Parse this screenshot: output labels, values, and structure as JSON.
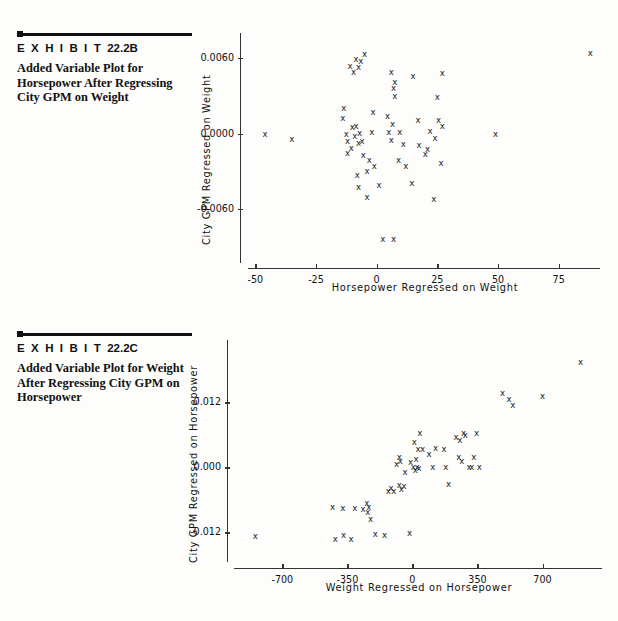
{
  "page": {
    "background": "#fdfdfb",
    "ink": "#111111"
  },
  "exhibits": [
    {
      "id": "22.2B",
      "label_word": "E X H I B I T",
      "number": "22.2B",
      "caption": "Added Variable Plot for Horsepower After Regressing City GPM on Weight"
    },
    {
      "id": "22.2C",
      "label_word": "E X H I B I T",
      "number": "22.2C",
      "caption": "Added Variable Plot for Weight After Regressing City GPM on Horsepower"
    }
  ],
  "chart_data": [
    {
      "type": "scatter",
      "title": "",
      "xlabel": "Horsepower Regressed on Weight",
      "ylabel": "City GPM Regressed on Weight",
      "xticks": [
        -50,
        -25,
        0,
        25,
        50,
        75
      ],
      "xticklabels": [
        "-50",
        "-25",
        "0",
        "25",
        "50",
        "75"
      ],
      "yticks": [
        0.006,
        0.0,
        -0.006
      ],
      "yticklabels": [
        "0.0060",
        "0.0000",
        "-0.0060"
      ],
      "xlim": [
        -53,
        92
      ],
      "ylim": [
        -0.0102,
        0.008
      ],
      "grid": false,
      "legend": "none",
      "marker": "x",
      "points": [
        [
          -46.0,
          0.0
        ],
        [
          -35.0,
          -0.00045
        ],
        [
          -12.5,
          0.0
        ],
        [
          -12.0,
          -0.0006
        ],
        [
          -10.5,
          -0.0011
        ],
        [
          -12.0,
          -0.0015
        ],
        [
          -9.0,
          -0.0002
        ],
        [
          -10.0,
          0.00052
        ],
        [
          -13.5,
          0.002
        ],
        [
          -14.0,
          0.00122
        ],
        [
          -11.0,
          0.0054
        ],
        [
          -9.5,
          0.00492
        ],
        [
          -8.5,
          0.0059
        ],
        [
          -7.5,
          0.0053
        ],
        [
          -6.5,
          0.00575
        ],
        [
          -5.0,
          0.0063
        ],
        [
          -8.5,
          0.0006
        ],
        [
          -7.0,
          5e-05
        ],
        [
          -7.5,
          -0.00075
        ],
        [
          -6.0,
          -0.00055
        ],
        [
          -5.5,
          -0.0017
        ],
        [
          -4.0,
          -0.003
        ],
        [
          -8.0,
          -0.0033
        ],
        [
          -7.5,
          -0.0042
        ],
        [
          -4.0,
          -0.005
        ],
        [
          -2.0,
          0.0001
        ],
        [
          -1.5,
          0.00175
        ],
        [
          -3.0,
          -0.0021
        ],
        [
          -1.0,
          -0.0026
        ],
        [
          1.0,
          -0.0041
        ],
        [
          2.5,
          -0.0084
        ],
        [
          7.0,
          -0.0084
        ],
        [
          5.0,
          0.0001
        ],
        [
          6.0,
          -0.0005
        ],
        [
          6.5,
          0.0008
        ],
        [
          4.5,
          0.0014
        ],
        [
          7.5,
          0.003
        ],
        [
          7.0,
          0.00365
        ],
        [
          7.5,
          0.00408
        ],
        [
          6.0,
          0.0049
        ],
        [
          9.5,
          0.00012
        ],
        [
          11.0,
          -0.0008
        ],
        [
          9.0,
          -0.0021
        ],
        [
          12.0,
          -0.00255
        ],
        [
          14.5,
          -0.0039
        ],
        [
          15.0,
          0.0046
        ],
        [
          17.0,
          0.0011
        ],
        [
          17.5,
          -0.0009
        ],
        [
          21.0,
          -0.0012
        ],
        [
          20.0,
          -0.00165
        ],
        [
          22.0,
          0.00025
        ],
        [
          25.0,
          0.0029
        ],
        [
          27.0,
          0.00485
        ],
        [
          25.5,
          0.00105
        ],
        [
          27.0,
          0.0006
        ],
        [
          24.0,
          -0.00035
        ],
        [
          26.5,
          -0.0023
        ],
        [
          23.5,
          -0.0052
        ],
        [
          49.0,
          0.0
        ],
        [
          88.0,
          0.00645
        ]
      ]
    },
    {
      "type": "scatter",
      "title": "",
      "xlabel": "Weight Regressed on Horsepower",
      "ylabel": "City GPM Regressed on Horsepower",
      "xticks": [
        -700,
        -350,
        0,
        350,
        700
      ],
      "xticklabels": [
        "-700",
        "-350",
        "0",
        "350",
        "700"
      ],
      "yticks": [
        0.012,
        0.0,
        -0.012
      ],
      "yticklabels": [
        "0.012",
        "0.000",
        "-0.012"
      ],
      "xlim": [
        -960,
        1020
      ],
      "ylim": [
        -0.0175,
        0.0235
      ],
      "grid": false,
      "legend": "none",
      "marker": "x",
      "points": [
        [
          -845.0,
          -0.0127
        ],
        [
          -415.0,
          -0.0132
        ],
        [
          -370.0,
          -0.0125
        ],
        [
          -330.0,
          -0.0133
        ],
        [
          -430.0,
          -0.00725
        ],
        [
          -375.0,
          -0.00755
        ],
        [
          -310.0,
          -0.0076
        ],
        [
          -265.0,
          -0.0077
        ],
        [
          -245.0,
          -0.00655
        ],
        [
          -235.0,
          -0.0074
        ],
        [
          -240.0,
          -0.0082
        ],
        [
          -225.0,
          -0.0096
        ],
        [
          -200.0,
          -0.0123
        ],
        [
          -150.0,
          -0.0125
        ],
        [
          -130.0,
          -0.0043
        ],
        [
          -115.0,
          -0.0038
        ],
        [
          -100.0,
          -0.0044
        ],
        [
          -70.0,
          -0.0032
        ],
        [
          -60.0,
          -0.004
        ],
        [
          -45.0,
          -0.00345
        ],
        [
          -15.0,
          -0.01215
        ],
        [
          -85.0,
          0.0006
        ],
        [
          -70.0,
          0.00185
        ],
        [
          -65.0,
          0.0012
        ],
        [
          -40.0,
          -0.00085
        ],
        [
          -10.0,
          0.001
        ],
        [
          5.0,
          5e-05
        ],
        [
          15.0,
          -0.00055
        ],
        [
          20.0,
          0.0015
        ],
        [
          25.0,
          0.0
        ],
        [
          35.0,
          -0.0001
        ],
        [
          10.0,
          0.0047
        ],
        [
          30.0,
          0.0033
        ],
        [
          55.0,
          0.0034
        ],
        [
          40.0,
          0.0064
        ],
        [
          90.0,
          0.0025
        ],
        [
          110.0,
          0.0
        ],
        [
          125.0,
          0.00355
        ],
        [
          170.0,
          0.0034
        ],
        [
          180.0,
          0.0001
        ],
        [
          195.0,
          -0.0031
        ],
        [
          235.0,
          0.0055
        ],
        [
          255.0,
          0.00505
        ],
        [
          250.0,
          0.0018
        ],
        [
          265.0,
          0.00115
        ],
        [
          275.0,
          0.0064
        ],
        [
          285.0,
          0.0059
        ],
        [
          305.0,
          0.0001
        ],
        [
          320.0,
          0.0001
        ],
        [
          330.0,
          0.00195
        ],
        [
          345.0,
          0.0063
        ],
        [
          360.0,
          0.0001
        ],
        [
          485.0,
          0.0137
        ],
        [
          520.0,
          0.01255
        ],
        [
          540.0,
          0.01145
        ],
        [
          700.0,
          0.0131
        ],
        [
          905.0,
          0.01935
        ]
      ]
    }
  ]
}
